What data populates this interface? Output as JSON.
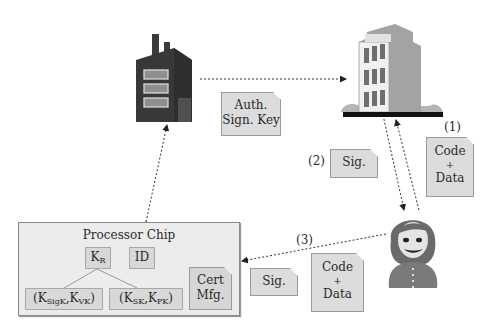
{
  "diagram": {
    "nodes": {
      "factory": {
        "icon": "factory-icon"
      },
      "building": {
        "icon": "office-building-icon"
      },
      "user": {
        "icon": "person-avatar-icon"
      }
    },
    "documents": {
      "auth_sign_key": {
        "line1": "Auth.",
        "line2": "Sign. Key"
      },
      "code_data_top": {
        "line1": "Code",
        "line2": "+",
        "line3": "Data"
      },
      "sig_top": {
        "line1": "Sig."
      },
      "sig_bottom": {
        "line1": "Sig."
      },
      "code_data_bottom": {
        "line1": "Code",
        "line2": "+",
        "line3": "Data"
      }
    },
    "step_labels": {
      "step1": "(1)",
      "step2": "(2)",
      "step3": "(3)"
    },
    "processor_chip": {
      "title": "Processor Chip",
      "kr": {
        "main": "K",
        "sub": "R"
      },
      "id": "ID",
      "pair1": {
        "open": "(K",
        "sub1": "SigK",
        "mid": ",K",
        "sub2": "VK",
        "close": ")"
      },
      "pair2": {
        "open": "(K",
        "sub1": "SK",
        "mid": ",K",
        "sub2": "PK",
        "close": ")"
      },
      "cert": {
        "line1": "Cert",
        "line2": "Mfg."
      }
    },
    "colors": {
      "factory": "#3a3a3a",
      "building_front": "#e8e8e8",
      "building_side": "#a6a6a6",
      "document_fill": "#dcdcdc",
      "chip_fill": "#ececec"
    }
  }
}
